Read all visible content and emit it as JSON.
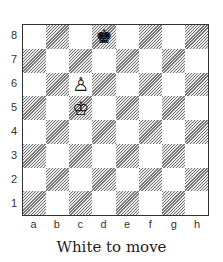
{
  "board": {
    "files": [
      "a",
      "b",
      "c",
      "d",
      "e",
      "f",
      "g",
      "h"
    ],
    "ranks": [
      "8",
      "7",
      "6",
      "5",
      "4",
      "3",
      "2",
      "1"
    ],
    "pieces": [
      {
        "square": "d8",
        "color": "black",
        "type": "king",
        "glyph": "♚"
      },
      {
        "square": "c6",
        "color": "white",
        "type": "pawn",
        "glyph": "♙"
      },
      {
        "square": "c5",
        "color": "white",
        "type": "king",
        "glyph": "♔"
      }
    ],
    "colors": {
      "light": "#ffffff",
      "dark_hatch": "#7a7a7a",
      "border": "#333333"
    }
  },
  "caption": "White to move"
}
